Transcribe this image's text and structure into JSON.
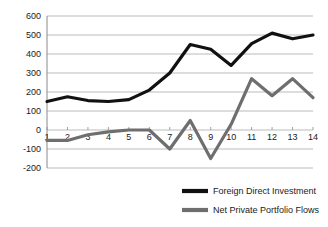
{
  "chart_data": {
    "type": "line",
    "title": "",
    "xlabel": "",
    "ylabel": "",
    "xlim": [
      1,
      14
    ],
    "ylim": [
      -200,
      600
    ],
    "ytick_step": 100,
    "grid": true,
    "legend_position": "bottom-center",
    "categories": [
      "1",
      "2",
      "3",
      "4",
      "5",
      "6",
      "7",
      "8",
      "9",
      "10",
      "11",
      "12",
      "13",
      "14"
    ],
    "x": [
      1,
      2,
      3,
      4,
      5,
      6,
      7,
      8,
      9,
      10,
      11,
      12,
      13,
      14
    ],
    "ytick_labels": [
      "600",
      "500",
      "400",
      "300",
      "200",
      "100",
      "0",
      "-100",
      "-200"
    ],
    "ytick_values": [
      600,
      500,
      400,
      300,
      200,
      100,
      0,
      -100,
      -200
    ],
    "series": [
      {
        "name": "Foreign Direct Investment",
        "color": "#111111",
        "width": 3.2,
        "values": [
          150,
          175,
          155,
          150,
          160,
          210,
          300,
          450,
          425,
          340,
          455,
          510,
          480,
          500
        ]
      },
      {
        "name": "Net Private Portfolio Flows",
        "color": "#6e6e6e",
        "width": 3.2,
        "values": [
          -55,
          -55,
          -25,
          -10,
          0,
          0,
          -100,
          50,
          -150,
          30,
          270,
          180,
          270,
          170
        ]
      }
    ]
  },
  "legend": {
    "items": [
      {
        "label": "Foreign Direct Investment",
        "color": "#111111"
      },
      {
        "label": "Net Private Portfolio Flows",
        "color": "#6e6e6e"
      }
    ]
  }
}
